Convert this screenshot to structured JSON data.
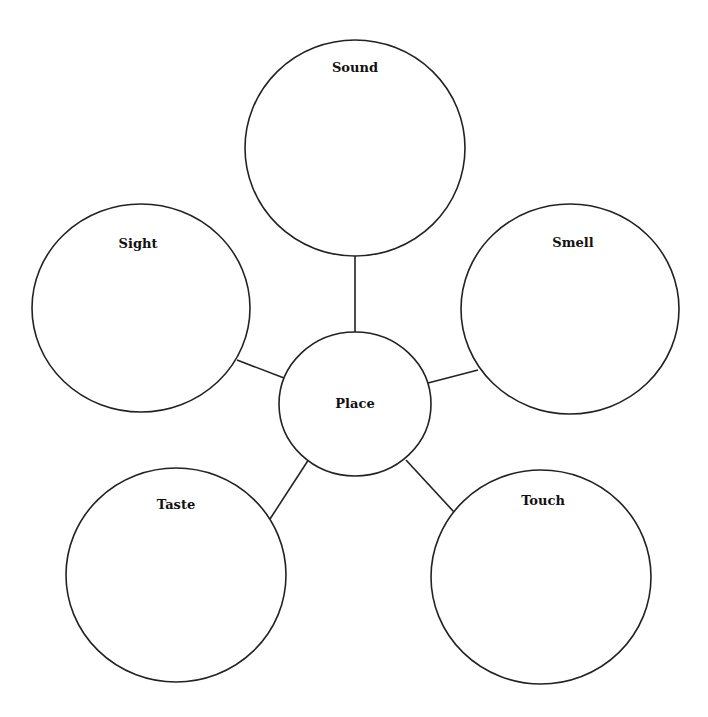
{
  "diagram": {
    "type": "web / cluster map",
    "center": {
      "label": "Place"
    },
    "nodes": [
      {
        "id": "sound",
        "label": "Sound"
      },
      {
        "id": "smell",
        "label": "Smell"
      },
      {
        "id": "touch",
        "label": "Touch"
      },
      {
        "id": "taste",
        "label": "Taste"
      },
      {
        "id": "sight",
        "label": "Sight"
      }
    ],
    "colors": {
      "stroke": "#222222",
      "background": "#ffffff",
      "text": "#111111"
    }
  }
}
